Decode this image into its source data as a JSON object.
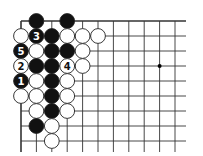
{
  "diagram": {
    "type": "go-board-fragment",
    "grid": {
      "origin_x": 21,
      "origin_y": 21,
      "spacing_x": 15.4,
      "spacing_y": 15.0,
      "columns": 11,
      "rows": 9,
      "line_extend_right": 186,
      "line_extend_bottom": 152,
      "top_edge": true,
      "left_edge": true
    },
    "star_points": [
      {
        "col": 9,
        "row": 3
      }
    ],
    "stones": [
      {
        "col": 1,
        "row": 0,
        "color": "black",
        "label": ""
      },
      {
        "col": 3,
        "row": 0,
        "color": "black",
        "label": ""
      },
      {
        "col": 0,
        "row": 1,
        "color": "white",
        "label": ""
      },
      {
        "col": 1,
        "row": 1,
        "color": "black",
        "label": "3"
      },
      {
        "col": 2,
        "row": 1,
        "color": "black",
        "label": ""
      },
      {
        "col": 3,
        "row": 1,
        "color": "white",
        "label": ""
      },
      {
        "col": 4,
        "row": 1,
        "color": "white",
        "label": ""
      },
      {
        "col": 5,
        "row": 1,
        "color": "white",
        "label": ""
      },
      {
        "col": 0,
        "row": 2,
        "color": "black",
        "label": "5"
      },
      {
        "col": 1,
        "row": 2,
        "color": "white",
        "label": ""
      },
      {
        "col": 2,
        "row": 2,
        "color": "black",
        "label": ""
      },
      {
        "col": 3,
        "row": 2,
        "color": "black",
        "label": ""
      },
      {
        "col": 4,
        "row": 2,
        "color": "white",
        "label": ""
      },
      {
        "col": 0,
        "row": 3,
        "color": "white",
        "label": "2"
      },
      {
        "col": 1,
        "row": 3,
        "color": "black",
        "label": ""
      },
      {
        "col": 2,
        "row": 3,
        "color": "black",
        "label": ""
      },
      {
        "col": 3,
        "row": 3,
        "color": "white",
        "label": "4"
      },
      {
        "col": 4,
        "row": 3,
        "color": "white",
        "label": ""
      },
      {
        "col": 0,
        "row": 4,
        "color": "black",
        "label": "1"
      },
      {
        "col": 1,
        "row": 4,
        "color": "white",
        "label": ""
      },
      {
        "col": 2,
        "row": 4,
        "color": "black",
        "label": ""
      },
      {
        "col": 3,
        "row": 4,
        "color": "white",
        "label": ""
      },
      {
        "col": 0,
        "row": 5,
        "color": "white",
        "label": ""
      },
      {
        "col": 1,
        "row": 5,
        "color": "white",
        "label": ""
      },
      {
        "col": 2,
        "row": 5,
        "color": "black",
        "label": ""
      },
      {
        "col": 3,
        "row": 5,
        "color": "white",
        "label": ""
      },
      {
        "col": 1,
        "row": 6,
        "color": "white",
        "label": ""
      },
      {
        "col": 2,
        "row": 6,
        "color": "black",
        "label": ""
      },
      {
        "col": 3,
        "row": 6,
        "color": "white",
        "label": ""
      },
      {
        "col": 1,
        "row": 7,
        "color": "black",
        "label": ""
      },
      {
        "col": 2,
        "row": 7,
        "color": "white",
        "label": ""
      },
      {
        "col": 2,
        "row": 8,
        "color": "white",
        "label": ""
      }
    ],
    "colors": {
      "background": "#ffffff",
      "line": "#333333",
      "black_stone": "#111111",
      "white_stone": "#ffffff",
      "stone_outline": "#222222"
    },
    "stone_radius": 7.4
  }
}
